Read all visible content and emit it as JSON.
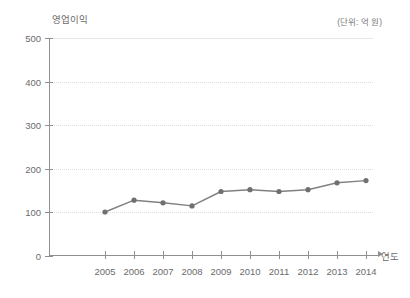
{
  "chart_data": {
    "type": "line",
    "title": "",
    "ylabel": "영업이익",
    "xlabel": "연도",
    "unit_note": "(단위: 억 원)",
    "categories": [
      "2005",
      "2006",
      "2007",
      "2008",
      "2009",
      "2010",
      "2011",
      "2012",
      "2013",
      "2014"
    ],
    "x": [
      2005,
      2006,
      2007,
      2008,
      2009,
      2010,
      2011,
      2012,
      2013,
      2014
    ],
    "values": [
      101,
      128,
      122,
      115,
      148,
      152,
      148,
      152,
      168,
      173
    ],
    "series": [
      {
        "name": "영업이익",
        "values": [
          101,
          128,
          122,
          115,
          148,
          152,
          148,
          152,
          168,
          173
        ]
      }
    ],
    "ylim": [
      0,
      500
    ],
    "y_ticks": [
      0,
      100,
      200,
      300,
      400,
      500
    ],
    "y_tick_labels": [
      "0",
      "100",
      "200",
      "300",
      "400",
      "500"
    ],
    "grid": true,
    "grid_axis": "y",
    "legend": false,
    "legend_position": "none",
    "markers": true,
    "marker_shape": "circle",
    "line_color": "#808080",
    "marker_color": "#707070",
    "grid_color": "#dcdce4",
    "axis_color": "#8f8f8f",
    "text_color": "#6b6b6b",
    "background_color": "#ffffff"
  }
}
